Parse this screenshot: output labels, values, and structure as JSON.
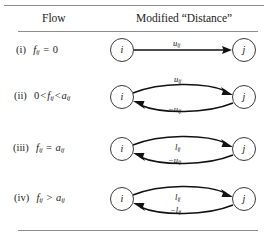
{
  "figure": {
    "headers": {
      "flow": "Flow",
      "distance": "Modified “Distance”"
    },
    "rows": [
      {
        "id": "i",
        "numeral": "(i)",
        "condition_text": "fᵢⱼ = 0",
        "condition": {
          "prefix": "",
          "var": "f",
          "sub": "ij",
          "op": "=",
          "rhs_var": "",
          "rhs": "0"
        },
        "source_node": "i",
        "target_node": "j",
        "arc_style": "straight",
        "arcs": [
          {
            "direction": "forward",
            "label_text": "uᵢⱼ",
            "label_main": "u",
            "label_sub": "ij",
            "negative": false
          }
        ]
      },
      {
        "id": "ii",
        "numeral": "(ii)",
        "condition_text": "0 < fᵢⱼ < aᵢⱼ",
        "condition": {
          "prefix": "0",
          "var": "f",
          "sub": "ij",
          "op": "<",
          "rhs_var": "a",
          "rhs": ""
        },
        "source_node": "i",
        "target_node": "j",
        "arc_style": "curved",
        "arcs": [
          {
            "direction": "forward",
            "label_text": "uᵢⱼ",
            "label_main": "u",
            "label_sub": "ij",
            "negative": false
          },
          {
            "direction": "backward",
            "label_text": "−uᵢⱼ",
            "label_main": "u",
            "label_sub": "ij",
            "negative": true
          }
        ]
      },
      {
        "id": "iii",
        "numeral": "(iii)",
        "condition_text": "fᵢⱼ = aᵢⱼ",
        "condition": {
          "prefix": "",
          "var": "f",
          "sub": "ij",
          "op": "=",
          "rhs_var": "a",
          "rhs": ""
        },
        "source_node": "i",
        "target_node": "j",
        "arc_style": "curved",
        "arcs": [
          {
            "direction": "forward",
            "label_text": "lᵢⱼ",
            "label_main": "l",
            "label_sub": "ij",
            "negative": false
          },
          {
            "direction": "backward",
            "label_text": "−uᵢⱼ",
            "label_main": "u",
            "label_sub": "ij",
            "negative": true
          }
        ]
      },
      {
        "id": "iv",
        "numeral": "(iv)",
        "condition_text": "fᵢⱼ > aᵢⱼ",
        "condition": {
          "prefix": "",
          "var": "f",
          "sub": "ij",
          "op": ">",
          "rhs_var": "a",
          "rhs": ""
        },
        "source_node": "i",
        "target_node": "j",
        "arc_style": "curved",
        "arcs": [
          {
            "direction": "forward",
            "label_text": "lᵢⱼ",
            "label_main": "l",
            "label_sub": "ij",
            "negative": false
          },
          {
            "direction": "backward",
            "label_text": "−lᵢⱼ",
            "label_main": "l",
            "label_sub": "ij",
            "negative": true
          }
        ]
      }
    ],
    "colors": {
      "rule": "#8d8d8d",
      "arc": "#111111",
      "node_border": "#3a3a3a",
      "text": "#1a1a1a",
      "background": "#ffffff"
    }
  }
}
